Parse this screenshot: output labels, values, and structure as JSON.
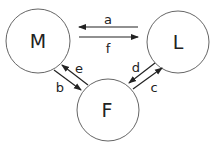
{
  "nodes": {
    "M": {
      "label": "M",
      "cx": 38,
      "cy": 41,
      "r": 32
    },
    "L": {
      "label": "L",
      "cx": 178,
      "cy": 42,
      "r": 31
    },
    "F": {
      "label": "F",
      "cx": 108,
      "cy": 110,
      "r": 31
    }
  },
  "edges": {
    "a": {
      "label": "a",
      "from": "L",
      "to": "M"
    },
    "f": {
      "label": "f",
      "from": "M",
      "to": "L"
    },
    "b": {
      "label": "b",
      "from": "M",
      "to": "F"
    },
    "e": {
      "label": "e",
      "from": "F",
      "to": "M"
    },
    "c": {
      "label": "c",
      "from": "F",
      "to": "L"
    },
    "d": {
      "label": "d",
      "from": "L",
      "to": "F"
    }
  },
  "colors": {
    "stroke": "#222222",
    "circle": "#555555"
  }
}
